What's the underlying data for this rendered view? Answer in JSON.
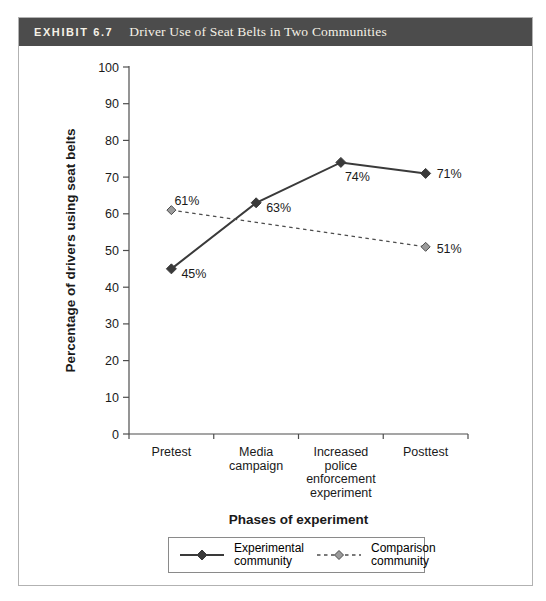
{
  "header": {
    "exhibit_label": "EXHIBIT 6.7",
    "title": "Driver Use of Seat Belts in Two Communities"
  },
  "colors": {
    "header_bg": "#4c4c4c",
    "header_text": "#f5f1e6",
    "panel_border": "#b2b2b2",
    "axis": "#4d4d4d",
    "experimental": "#3a3a3a",
    "comparison_line": "#4d4d4d",
    "comparison_marker_fill": "#9b9b9b",
    "label_text": "#1a1a1a"
  },
  "chart_data": {
    "type": "line",
    "title": "Driver Use of Seat Belts in Two Communities",
    "xlabel": "Phases of experiment",
    "ylabel": "Percentage of drivers using seat belts",
    "ylim": [
      0,
      100
    ],
    "ytick_step": 10,
    "grid": false,
    "legend_position": "bottom",
    "categories": [
      "Pretest",
      "Media\ncampaign",
      "Increased\npolice\nenforcement\nexperiment",
      "Posttest"
    ],
    "series": [
      {
        "name": "Experimental community",
        "legend_lines": [
          "Experimental",
          "community"
        ],
        "line_style": "solid",
        "points": [
          {
            "category_index": 0,
            "value": 45,
            "label": "45%",
            "label_dx": 10,
            "label_dy": 9
          },
          {
            "category_index": 1,
            "value": 63,
            "label": "63%",
            "label_dx": 10,
            "label_dy": 9
          },
          {
            "category_index": 2,
            "value": 74,
            "label": "74%",
            "label_dx": 4,
            "label_dy": 19
          },
          {
            "category_index": 3,
            "value": 71,
            "label": "71%",
            "label_dx": 11,
            "label_dy": 5
          }
        ]
      },
      {
        "name": "Comparison community",
        "legend_lines": [
          "Comparison",
          "community"
        ],
        "line_style": "dashed",
        "points": [
          {
            "category_index": 0,
            "value": 61,
            "label": "61%",
            "label_dx": 3,
            "label_dy": -5
          },
          {
            "category_index": 3,
            "value": 51,
            "label": "51%",
            "label_dx": 11,
            "label_dy": 6
          }
        ]
      }
    ]
  }
}
